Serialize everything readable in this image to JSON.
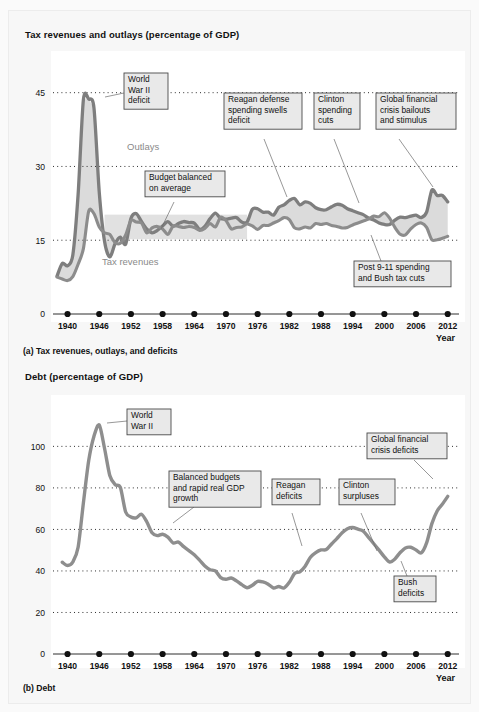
{
  "figure": {
    "panel_a": {
      "title": "Tax revenues and outlays (percentage of GDP)",
      "caption": "(a) Tax revenues, outlays, and deficits",
      "x_axis_title": "Year",
      "series_labels": {
        "outlays": "Outlays",
        "revenues": "Tax revenues"
      },
      "callouts": [
        {
          "id": "wwii",
          "text": [
            "World",
            "War II",
            "deficit"
          ]
        },
        {
          "id": "reagan",
          "text": [
            "Reagan defense",
            "spending swells",
            "deficit"
          ]
        },
        {
          "id": "clinton",
          "text": [
            "Clinton",
            "spending",
            "cuts"
          ]
        },
        {
          "id": "gfc",
          "text": [
            "Global financial",
            "crisis bailouts",
            "and stimulus"
          ]
        },
        {
          "id": "balanced",
          "text": [
            "Budget balanced",
            "on average"
          ]
        },
        {
          "id": "post911",
          "text": [
            "Post 9-11 spending",
            "and Bush tax cuts"
          ]
        }
      ]
    },
    "panel_b": {
      "title": "Debt (percentage of GDP)",
      "caption": "(b) Debt",
      "x_axis_title": "Year",
      "callouts": [
        {
          "id": "wwii",
          "text": [
            "World",
            "War II"
          ]
        },
        {
          "id": "balanced-growth",
          "text": [
            "Balanced budgets",
            "and rapid real GDP",
            "growth"
          ]
        },
        {
          "id": "reagan",
          "text": [
            "Reagan",
            "deficits"
          ]
        },
        {
          "id": "clinton",
          "text": [
            "Clinton",
            "surpluses"
          ]
        },
        {
          "id": "gfc",
          "text": [
            "Global financial",
            "crisis deficits"
          ]
        },
        {
          "id": "bush",
          "text": [
            "Bush",
            "deficits"
          ]
        }
      ]
    }
  },
  "colors": {
    "curve": "#8c8c8c",
    "gap_fill": "#d9d9d9",
    "band": "#dcdcdc",
    "callout_fill": "#e9e9e9",
    "callout_stroke": "#4a4a4a",
    "grid": "#2f2f2f",
    "text": "#111111",
    "plot_bg": "#ffffff",
    "page_bg": "#f7f7f7"
  },
  "chart_data": [
    {
      "type": "line",
      "id": "panel-a",
      "title": "Tax revenues and outlays (percentage of GDP)",
      "xlabel": "Year",
      "ylabel": "",
      "xlim": [
        1938,
        2013
      ],
      "ylim": [
        0,
        49
      ],
      "yticks": [
        0,
        15,
        30,
        45
      ],
      "xticks": [
        1940,
        1946,
        1952,
        1958,
        1964,
        1970,
        1976,
        1982,
        1988,
        1994,
        2000,
        2006,
        2012
      ],
      "grid": true,
      "legend": "inline-labels",
      "x": [
        1938,
        1939,
        1940,
        1941,
        1942,
        1943,
        1944,
        1945,
        1946,
        1947,
        1948,
        1949,
        1950,
        1951,
        1952,
        1953,
        1954,
        1955,
        1956,
        1957,
        1958,
        1959,
        1960,
        1961,
        1962,
        1963,
        1964,
        1965,
        1966,
        1967,
        1968,
        1969,
        1970,
        1971,
        1972,
        1973,
        1974,
        1975,
        1976,
        1977,
        1978,
        1979,
        1980,
        1981,
        1982,
        1983,
        1984,
        1985,
        1986,
        1987,
        1988,
        1989,
        1990,
        1991,
        1992,
        1993,
        1994,
        1995,
        1996,
        1997,
        1998,
        1999,
        2000,
        2001,
        2002,
        2003,
        2004,
        2005,
        2006,
        2007,
        2008,
        2009,
        2010,
        2011,
        2012
      ],
      "series": [
        {
          "name": "Outlays",
          "values": [
            7.7,
            10.3,
            9.8,
            12.0,
            24.3,
            43.6,
            43.7,
            41.9,
            24.8,
            14.8,
            11.6,
            14.3,
            15.6,
            14.2,
            19.4,
            20.4,
            18.8,
            17.3,
            16.5,
            17.0,
            17.9,
            18.8,
            17.8,
            18.4,
            18.8,
            18.6,
            18.5,
            17.2,
            17.8,
            19.4,
            20.5,
            19.4,
            19.3,
            19.5,
            19.6,
            18.7,
            18.7,
            21.3,
            21.4,
            20.7,
            20.7,
            20.1,
            21.7,
            22.2,
            23.1,
            23.5,
            22.2,
            22.8,
            22.5,
            21.6,
            21.2,
            21.2,
            21.8,
            22.3,
            22.1,
            21.4,
            21.0,
            20.6,
            20.2,
            19.5,
            19.1,
            18.5,
            18.2,
            18.2,
            19.1,
            19.7,
            19.6,
            19.9,
            20.1,
            19.6,
            20.7,
            25.2,
            24.1,
            24.1,
            22.8
          ]
        },
        {
          "name": "Tax revenues",
          "values": [
            7.5,
            7.1,
            6.8,
            7.6,
            10.1,
            13.3,
            20.9,
            20.4,
            17.7,
            16.5,
            16.2,
            14.5,
            14.4,
            16.1,
            19.0,
            18.7,
            18.5,
            16.5,
            17.5,
            17.8,
            17.3,
            16.2,
            17.9,
            17.8,
            17.6,
            17.8,
            17.6,
            17.0,
            17.4,
            18.4,
            17.7,
            19.7,
            19.0,
            17.3,
            17.6,
            17.7,
            18.3,
            17.9,
            17.2,
            18.0,
            18.0,
            18.5,
            19.0,
            19.6,
            19.2,
            17.5,
            17.3,
            17.7,
            17.5,
            18.4,
            18.2,
            18.4,
            18.0,
            17.8,
            17.5,
            17.6,
            18.1,
            18.5,
            18.9,
            19.3,
            19.9,
            19.8,
            20.6,
            19.5,
            17.6,
            16.2,
            16.1,
            17.3,
            18.2,
            18.5,
            17.6,
            15.1,
            15.1,
            15.4,
            15.8
          ]
        }
      ]
    },
    {
      "type": "line",
      "id": "panel-b",
      "title": "Debt (percentage of GDP)",
      "xlabel": "Year",
      "ylabel": "",
      "xlim": [
        1938,
        2013
      ],
      "ylim": [
        0,
        118
      ],
      "yticks": [
        0,
        20,
        40,
        60,
        80,
        100
      ],
      "xticks": [
        1940,
        1946,
        1952,
        1958,
        1964,
        1970,
        1976,
        1982,
        1988,
        1994,
        2000,
        2006,
        2012
      ],
      "grid": true,
      "x": [
        1939,
        1940,
        1941,
        1942,
        1943,
        1944,
        1945,
        1946,
        1947,
        1948,
        1949,
        1950,
        1951,
        1952,
        1953,
        1954,
        1955,
        1956,
        1957,
        1958,
        1959,
        1960,
        1961,
        1962,
        1963,
        1964,
        1965,
        1966,
        1967,
        1968,
        1969,
        1970,
        1971,
        1972,
        1973,
        1974,
        1975,
        1976,
        1977,
        1978,
        1979,
        1980,
        1981,
        1982,
        1983,
        1984,
        1985,
        1986,
        1987,
        1988,
        1989,
        1990,
        1991,
        1992,
        1993,
        1994,
        1995,
        1996,
        1997,
        1998,
        1999,
        2000,
        2001,
        2002,
        2003,
        2004,
        2005,
        2006,
        2007,
        2008,
        2009,
        2010,
        2011,
        2012
      ],
      "series": [
        {
          "name": "Debt",
          "values": [
            44.2,
            42.6,
            44.3,
            51.4,
            72.8,
            93.1,
            104.9,
            110.3,
            99.1,
            86.0,
            81.6,
            80.2,
            68.4,
            66.0,
            65.6,
            67.3,
            63.7,
            58.4,
            57.0,
            57.7,
            56.3,
            53.5,
            53.9,
            51.7,
            49.8,
            47.8,
            45.2,
            42.4,
            40.6,
            40.0,
            36.8,
            36.0,
            36.6,
            35.2,
            33.4,
            31.9,
            33.1,
            35.0,
            34.7,
            33.6,
            31.8,
            32.5,
            31.8,
            34.5,
            38.8,
            39.6,
            42.3,
            46.6,
            48.8,
            50.1,
            50.3,
            53.0,
            55.6,
            58.4,
            60.3,
            60.9,
            60.1,
            59.2,
            56.2,
            53.1,
            50.0,
            46.8,
            44.3,
            45.8,
            48.9,
            51.1,
            51.4,
            50.1,
            48.7,
            53.5,
            62.8,
            68.9,
            72.2,
            75.9
          ]
        }
      ]
    }
  ]
}
